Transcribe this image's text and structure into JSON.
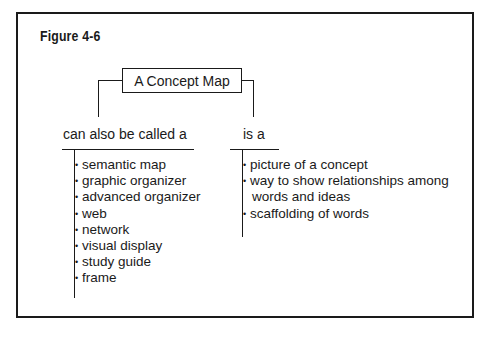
{
  "figure": {
    "title": "Figure 4-6",
    "root": {
      "label": "A Concept Map"
    },
    "branches": [
      {
        "label": "can also be called a",
        "items": [
          "semantic map",
          "graphic organizer",
          "advanced organizer",
          "web",
          "network",
          "visual display",
          "study guide",
          "frame"
        ]
      },
      {
        "label": "is a",
        "items": [
          "picture of a concept",
          "way to show relationships among",
          "scaffolding of words"
        ],
        "item_continuations": {
          "1": "words and ideas"
        }
      }
    ],
    "bullet_glyph": "•",
    "colors": {
      "ink": "#1a1a1a",
      "background": "#ffffff"
    }
  }
}
